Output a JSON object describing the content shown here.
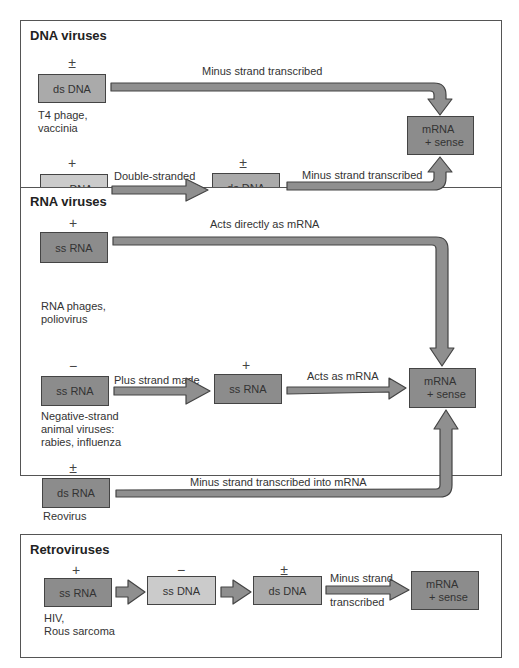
{
  "panels": {
    "dna": {
      "title": "DNA viruses",
      "row1": {
        "sign": "±",
        "box": "ds DNA",
        "caption_line1": "T4 phage,",
        "caption_line2": "vaccinia",
        "arrow_label": "Minus strand transcribed"
      },
      "row2": {
        "sign": "+",
        "box": "ss DNA",
        "caption": "φX174 phage",
        "arrow1_label_line1": "Double-stranded",
        "arrow1_label_line2": "form made",
        "mid_sign": "±",
        "mid_box": "ds DNA",
        "arrow2_label": "Minus strand transcribed"
      },
      "mrna_line1": "mRNA",
      "mrna_line2": "+ sense"
    },
    "rna": {
      "title": "RNA viruses",
      "row1": {
        "sign": "+",
        "box": "ss RNA",
        "caption_line1": "RNA phages,",
        "caption_line2": "poliovirus",
        "arrow_label": "Acts directly as mRNA"
      },
      "row2": {
        "sign": "−",
        "box": "ss RNA",
        "caption_line1": "Negative-strand",
        "caption_line2": "animal viruses:",
        "caption_line3": "rabies, influenza",
        "arrow1_label": "Plus strand made",
        "mid_sign": "+",
        "mid_box": "ss RNA",
        "arrow2_label": "Acts as mRNA"
      },
      "row3": {
        "sign": "±",
        "box": "ds RNA",
        "caption": "Reovirus",
        "arrow_label": "Minus strand transcribed into mRNA"
      },
      "mrna_line1": "mRNA",
      "mrna_line2": "+ sense"
    },
    "retro": {
      "title": "Retroviruses",
      "box1_sign": "+",
      "box1": "ss RNA",
      "caption_line1": "HIV,",
      "caption_line2": "Rous sarcoma",
      "box2_sign": "−",
      "box2": "ss DNA",
      "box3_sign": "±",
      "box3": "ds DNA",
      "arrow_label_line1": "Minus strand",
      "arrow_label_line2": "transcribed",
      "mrna_line1": "mRNA",
      "mrna_line2": "+ sense"
    }
  },
  "colors": {
    "light_box": "#cbcbcb",
    "dark_box": "#8c8c8c",
    "arrow_fill": "#8f8f8f",
    "border": "#444444"
  }
}
